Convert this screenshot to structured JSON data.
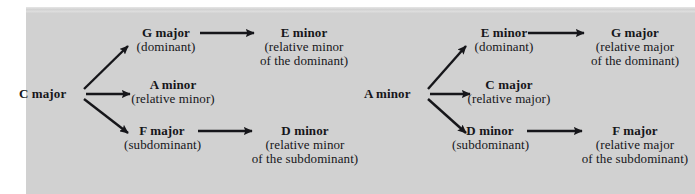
{
  "figure": {
    "type": "music-theory-relationship-diagram",
    "background_color": "#d5d5d5",
    "text_color": "#16161a",
    "page_background": "#ffffff"
  },
  "diagrams": [
    {
      "id": "c-major-diagram",
      "root": {
        "label": "C major"
      },
      "branches": [
        {
          "id": "dominant-branch",
          "arrow": "up-right-arrow",
          "node": {
            "head": "G major",
            "sub": "(dominant)"
          },
          "next_arrow": "right-arrow",
          "next": {
            "head": "E minor",
            "sub1": "(relative minor",
            "sub2": "of the dominant)"
          }
        },
        {
          "id": "relative-minor-branch",
          "arrow": "right-arrow",
          "node": {
            "head": "A minor",
            "sub": "(relative minor)"
          }
        },
        {
          "id": "subdominant-branch",
          "arrow": "down-right-arrow",
          "node": {
            "head": "F major",
            "sub": "(subdominant)"
          },
          "next_arrow": "right-arrow",
          "next": {
            "head": "D minor",
            "sub1": "(relative minor",
            "sub2": "of the subdominant)"
          }
        }
      ]
    },
    {
      "id": "a-minor-diagram",
      "root": {
        "label": "A minor"
      },
      "branches": [
        {
          "id": "dominant-branch",
          "arrow": "up-right-arrow",
          "node": {
            "head": "E minor",
            "sub": "(dominant)"
          },
          "next_arrow": "right-arrow",
          "next": {
            "head": "G major",
            "sub1": "(relative major",
            "sub2": "of the dominant)"
          }
        },
        {
          "id": "relative-major-branch",
          "arrow": "right-arrow",
          "node": {
            "head": "C major",
            "sub": "(relative major)"
          }
        },
        {
          "id": "subdominant-branch",
          "arrow": "down-right-arrow",
          "node": {
            "head": "D minor",
            "sub": "(subdominant)"
          },
          "next_arrow": "right-arrow",
          "next": {
            "head": "F major",
            "sub1": "(relative major",
            "sub2": "of the subdominant)"
          }
        }
      ]
    }
  ]
}
